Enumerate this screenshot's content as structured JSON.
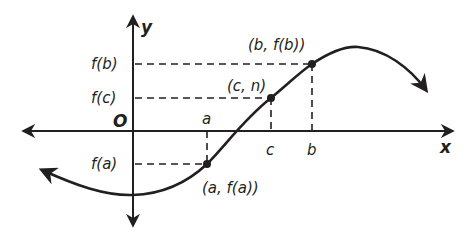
{
  "diagram": {
    "type": "function-graph",
    "axes": {
      "x_label": "x",
      "y_label": "y",
      "origin_label": "O"
    },
    "y_tick_labels": {
      "fb": "f(b)",
      "fc": "f(c)",
      "fa": "f(a)"
    },
    "x_tick_labels": {
      "a": "a",
      "c": "c",
      "b": "b"
    },
    "points": [
      {
        "id": "a",
        "label": "(a, f(a))"
      },
      {
        "id": "c",
        "label": "(c, n)"
      },
      {
        "id": "b",
        "label": "(b, f(b))"
      }
    ],
    "colors": {
      "ink": "#231f20",
      "background": "#ffffff"
    }
  }
}
